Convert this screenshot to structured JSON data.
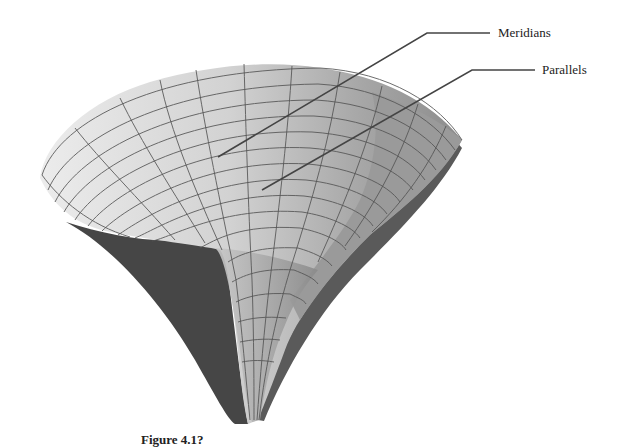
{
  "figure": {
    "type": "3d-surface-illustration",
    "annotations": [
      {
        "label": "Meridians",
        "target": "meridian lines on surface"
      },
      {
        "label": "Parallels",
        "target": "parallel lines on surface"
      }
    ],
    "caption": {
      "number": "Figure 4.1?",
      "text": "(caption truncated at image bottom)"
    },
    "colors": {
      "background": "#ffffff",
      "surface_light": "#e2e2e2",
      "surface_mid": "#bdbdbd",
      "surface_dark": "#8a8a8a",
      "surface_shadow": "#4a4a4a",
      "mesh_line": "#555555",
      "leader_line": "#444444",
      "text": "#222222"
    }
  }
}
